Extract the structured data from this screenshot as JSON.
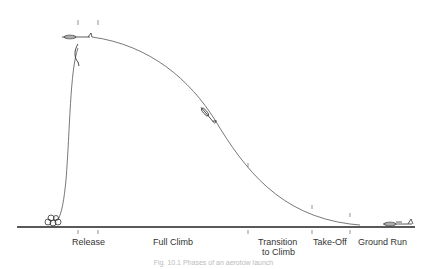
{
  "diagram": {
    "type": "flight-profile",
    "phases": [
      {
        "label": "Release",
        "x": 88
      },
      {
        "label": "Full Climb",
        "x": 176
      },
      {
        "label": "Transition\nto Climb",
        "x": 287
      },
      {
        "label": "Take-Off",
        "x": 330
      },
      {
        "label": "Ground Run",
        "x": 386
      }
    ],
    "labels": {
      "release": "Release",
      "full_climb": "Full Climb",
      "transition_1": "Transition",
      "transition_2": "to Climb",
      "take_off": "Take-Off",
      "ground_run": "Ground Run"
    },
    "caption": "Fig. 10.1  Phases of an aerotow launch",
    "colors": {
      "line": "#333333",
      "ground": "#222222",
      "text": "#333333"
    }
  }
}
